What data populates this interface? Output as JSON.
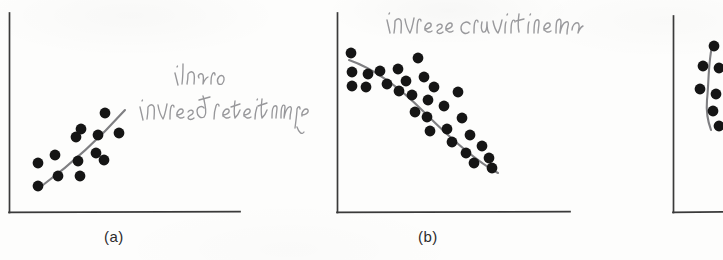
{
  "figure": {
    "kind": "scanned-textbook-figure",
    "background_color": "#fdfdfc",
    "ink_color": "#1a1a1a",
    "axis_color": "#3a3a3a",
    "pencil_color": "#8e8e90",
    "trendline_color": "#7a7a7c"
  },
  "panels": [
    {
      "id": "a",
      "caption": "(a)",
      "annotation_lines": [
        "linear",
        "inversed relationship"
      ],
      "axes": {
        "x0": 9,
        "y0": 212,
        "x1": 240,
        "y1": 13
      }
    },
    {
      "id": "b",
      "caption": "(b)",
      "annotation_lines": [
        "inverse curvilinear"
      ],
      "axes": {
        "x0": 337,
        "y0": 212,
        "x1": 570,
        "y1": 13
      }
    },
    {
      "id": "c",
      "caption": "",
      "annotation_lines": [],
      "axes": {
        "x0": 673,
        "y0": 212,
        "x1": 723,
        "y1": 16
      }
    }
  ],
  "chart_data": [
    {
      "type": "scatter",
      "title": "(a)",
      "annotation": "linear inversed relationship",
      "xlabel": "",
      "ylabel": "",
      "xlim": [
        9,
        240
      ],
      "ylim": [
        212,
        13
      ],
      "grid": false,
      "legend": "none",
      "points": [
        [
          38,
          186
        ],
        [
          38,
          163
        ],
        [
          55,
          155
        ],
        [
          58,
          176
        ],
        [
          76,
          137
        ],
        [
          78,
          161
        ],
        [
          80,
          176
        ],
        [
          81,
          129
        ],
        [
          98,
          135
        ],
        [
          96,
          153
        ],
        [
          105,
          113
        ],
        [
          104,
          160
        ],
        [
          119,
          133
        ]
      ],
      "trendline": {
        "from": [
          43,
          184
        ],
        "to": [
          124,
          110
        ]
      }
    },
    {
      "type": "scatter",
      "title": "(b)",
      "annotation": "inverse curvilinear",
      "xlabel": "",
      "ylabel": "",
      "xlim": [
        337,
        570
      ],
      "ylim": [
        212,
        13
      ],
      "grid": false,
      "legend": "none",
      "points": [
        [
          351,
          53
        ],
        [
          352,
          72
        ],
        [
          352,
          86
        ],
        [
          368,
          74
        ],
        [
          366,
          87
        ],
        [
          380,
          71
        ],
        [
          387,
          84
        ],
        [
          398,
          69
        ],
        [
          399,
          91
        ],
        [
          406,
          81
        ],
        [
          412,
          95
        ],
        [
          415,
          112
        ],
        [
          418,
          58
        ],
        [
          424,
          77
        ],
        [
          428,
          100
        ],
        [
          427,
          117
        ],
        [
          430,
          131
        ],
        [
          434,
          87
        ],
        [
          444,
          106
        ],
        [
          447,
          129
        ],
        [
          452,
          142
        ],
        [
          458,
          92
        ],
        [
          462,
          118
        ],
        [
          466,
          153
        ],
        [
          470,
          135
        ],
        [
          474,
          163
        ],
        [
          482,
          146
        ],
        [
          489,
          158
        ],
        [
          492,
          168
        ]
      ],
      "trendline": "smooth decreasing curve from (350,62) to (498,172)"
    },
    {
      "type": "scatter",
      "title": "",
      "annotation": "",
      "xlabel": "",
      "ylabel": "",
      "xlim": [
        673,
        723
      ],
      "ylim": [
        212,
        16
      ],
      "grid": false,
      "legend": "none",
      "points": [
        [
          714,
          46
        ],
        [
          703,
          66
        ],
        [
          719,
          68
        ],
        [
          700,
          89
        ],
        [
          716,
          94
        ],
        [
          713,
          111
        ],
        [
          719,
          126
        ]
      ],
      "trendline": "short near-vertical curve (panel cropped at image edge)"
    }
  ]
}
